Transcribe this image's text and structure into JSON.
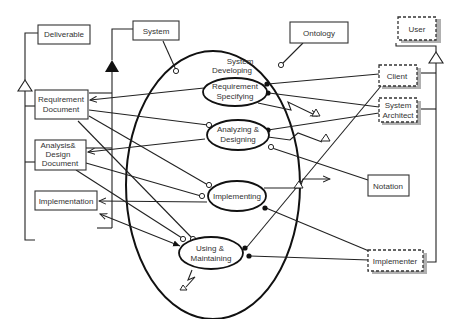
{
  "diagram": {
    "boxes": {
      "deliverable": "Deliverable",
      "system": "System",
      "ontology": "Ontology",
      "requirement_document": [
        "Requirement",
        "Document"
      ],
      "analysis_design_document": [
        "Analysis&",
        "Design",
        "Document"
      ],
      "implementation": "Implementation",
      "notation": "Notation"
    },
    "agents": {
      "user": "User",
      "client": "Client",
      "system_architect": [
        "System",
        "Architect"
      ],
      "implementer": "Implementer"
    },
    "processes": {
      "container": [
        "System",
        "Developing"
      ],
      "requirement_specifying": [
        "Requirement",
        "Specifying"
      ],
      "analyzing_designing": [
        "Analyzing &",
        "Designing"
      ],
      "implementing": "Implementing",
      "using_maintaining": [
        "Using &",
        "Maintaining"
      ]
    },
    "colors": {
      "line": "#222222",
      "shadow": "#b0b0b0",
      "text": "#333333",
      "background": "#ffffff"
    }
  }
}
